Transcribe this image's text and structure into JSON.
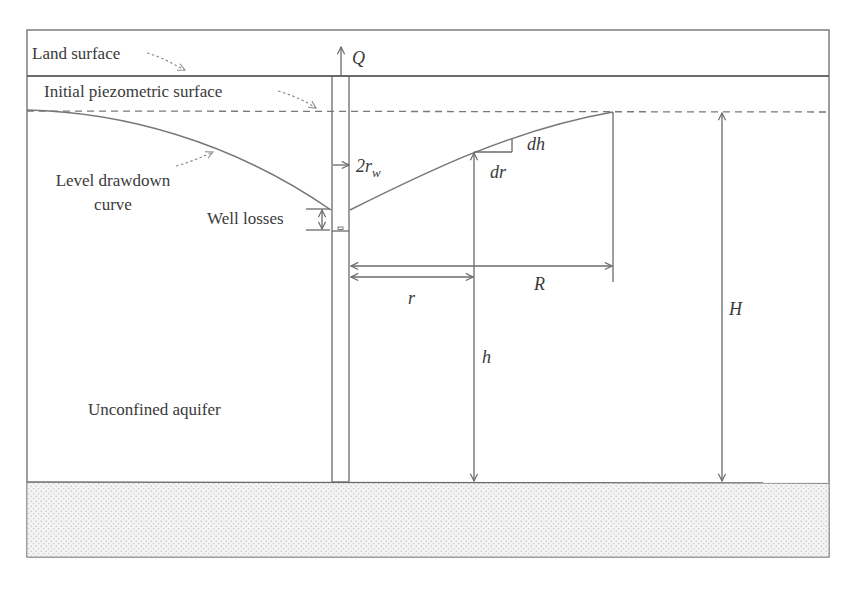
{
  "diagram": {
    "labels": {
      "land_surface": "Land surface",
      "initial_piezometric_surface": "Initial piezometric surface",
      "level_drawdown_curve_line1": "Level drawdown",
      "level_drawdown_curve_line2": "curve",
      "well_losses": "Well losses",
      "unconfined_aquifer": "Unconfined aquifer"
    },
    "symbols": {
      "discharge": "Q",
      "well_diameter_prefix": "2r",
      "well_diameter_subscript": "w",
      "dh": "dh",
      "dr": "dr",
      "radius": "r",
      "radius_of_influence": "R",
      "head": "h",
      "saturated_thickness": "H"
    },
    "colors": {
      "line": "#6a6a6a",
      "text": "#3a3a3a",
      "bedrock_fill": "#f2f2f2",
      "bedrock_dots": "#b8b8b8"
    }
  }
}
